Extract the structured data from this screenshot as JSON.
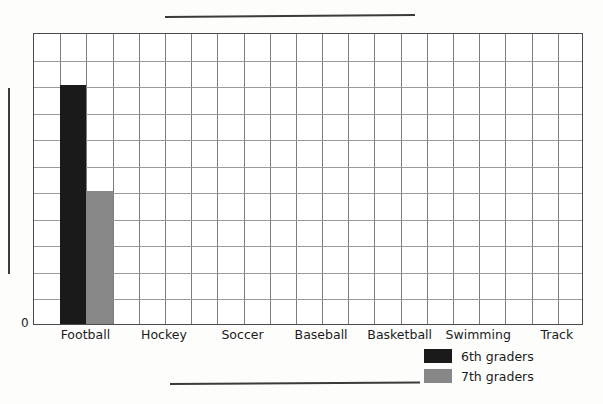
{
  "worksheet": {
    "title_line_placeholder": "",
    "xlabel_line_placeholder": "",
    "ylabel_line_placeholder": ""
  },
  "axis": {
    "origin_label": "0"
  },
  "legend": {
    "items": [
      {
        "label": "6th graders",
        "color": "#1a1a1a",
        "swatch_name": "legend-swatch-6th"
      },
      {
        "label": "7th graders",
        "color": "#878787",
        "swatch_name": "legend-swatch-7th"
      }
    ]
  },
  "chart_data": {
    "type": "bar",
    "title": "",
    "xlabel": "",
    "ylabel": "",
    "categories": [
      "Football",
      "Hockey",
      "Soccer",
      "Baseball",
      "Basketball",
      "Swimming",
      "Track"
    ],
    "series": [
      {
        "name": "6th graders",
        "color": "#1a1a1a",
        "values": [
          9,
          0,
          0,
          0,
          0,
          0,
          0
        ]
      },
      {
        "name": "7th graders",
        "color": "#878787",
        "values": [
          5,
          0,
          0,
          0,
          0,
          0,
          0
        ]
      }
    ],
    "ylim": [
      0,
      11
    ],
    "grid": true,
    "grid_rows": 11,
    "grid_cols": 21,
    "tick_labels_y": [
      "0"
    ],
    "legend_position": "bottom-right"
  }
}
